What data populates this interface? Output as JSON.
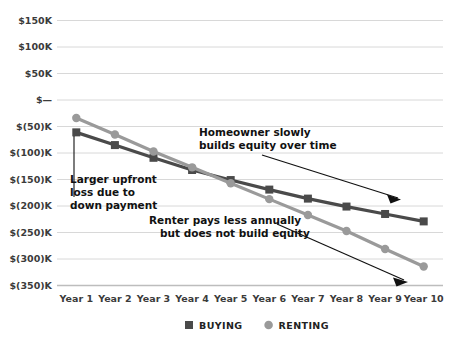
{
  "chart_data": {
    "type": "line",
    "title": "",
    "xlabel": "",
    "ylabel": "",
    "categories": [
      "Year 1",
      "Year 2",
      "Year 3",
      "Year 4",
      "Year 5",
      "Year 6",
      "Year 7",
      "Year 8",
      "Year 9",
      "Year 10"
    ],
    "ylim": [
      -350000,
      150000
    ],
    "ytick_values": [
      150000,
      100000,
      50000,
      0,
      -50000,
      -100000,
      -150000,
      -200000,
      -250000,
      -300000,
      -350000
    ],
    "ytick_labels": [
      "$150K",
      "$100K",
      "$50K",
      "$—",
      "$(50)K",
      "$(100)K",
      "$(150)K",
      "$(200)K",
      "$(250)K",
      "$(300)K",
      "$(350)K"
    ],
    "grid": true,
    "legend_position": "bottom",
    "series": [
      {
        "name": "BUYING",
        "color": "#4a4a4a",
        "marker": "square",
        "values": [
          -62000,
          -86000,
          -110000,
          -133000,
          -152000,
          -170000,
          -187000,
          -202000,
          -216000,
          -230000
        ]
      },
      {
        "name": "RENTING",
        "color": "#9a9a9a",
        "marker": "circle",
        "values": [
          -35000,
          -66000,
          -98000,
          -128000,
          -158000,
          -188000,
          -218000,
          -248000,
          -282000,
          -315000
        ]
      }
    ],
    "annotations": [
      {
        "id": "down-payment-note",
        "lines": [
          "Larger upfront",
          "loss due to",
          "down payment"
        ]
      },
      {
        "id": "equity-note",
        "lines": [
          "Homeowner slowly",
          "builds equity over time"
        ]
      },
      {
        "id": "renter-note",
        "lines": [
          "Renter pays less annually",
          "but does not build equity"
        ]
      }
    ]
  },
  "legend": {
    "items": [
      {
        "label": "BUYING",
        "color": "#4a4a4a",
        "marker": "square"
      },
      {
        "label": "RENTING",
        "color": "#9a9a9a",
        "marker": "circle"
      }
    ]
  },
  "colors": {
    "buying": "#4a4a4a",
    "renting": "#9a9a9a",
    "gridline": "#d8d8d8",
    "axis": "#bdbdbd",
    "text": "#3b3b3b",
    "annotation": "#111111",
    "background": "#ffffff"
  }
}
